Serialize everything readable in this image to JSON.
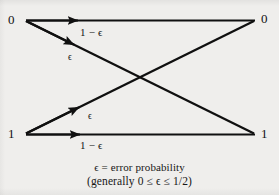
{
  "figure": {
    "kind": "binary-symmetric-channel-diagram",
    "background_color": "#efeeec",
    "ink_color": "#101010"
  },
  "nodes": {
    "input_top": "0",
    "input_bottom": "1",
    "output_top": "0",
    "output_bottom": "1"
  },
  "edges": [
    {
      "id": "zero-to-zero",
      "from": "0",
      "to": "0",
      "label": "1 − ϵ",
      "kind": "correct",
      "path": "horizontal-top"
    },
    {
      "id": "zero-to-one",
      "from": "0",
      "to": "1",
      "label": "ϵ",
      "kind": "error",
      "path": "diagonal-down"
    },
    {
      "id": "one-to-zero",
      "from": "1",
      "to": "0",
      "label": "ϵ",
      "kind": "error",
      "path": "diagonal-up"
    },
    {
      "id": "one-to-one",
      "from": "1",
      "to": "1",
      "label": "1 − ϵ",
      "kind": "correct",
      "path": "horizontal-bottom"
    }
  ],
  "caption": {
    "line1": "ϵ = error probability",
    "line2": "(generally 0 ≤ ϵ ≤ 1/2)"
  }
}
